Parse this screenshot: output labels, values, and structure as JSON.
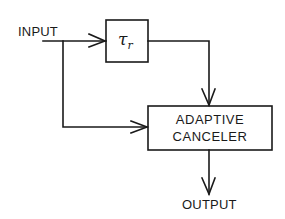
{
  "diagram": {
    "input_label": "INPUT",
    "output_label": "OUTPUT",
    "delay_block": {
      "symbol": "τ",
      "subscript": "r"
    },
    "canceler_block": {
      "line1": "ADAPTIVE",
      "line2": "CANCELER"
    },
    "connections": [
      {
        "from": "INPUT",
        "to": "delay_block"
      },
      {
        "from": "delay_block",
        "to": "canceler_block"
      },
      {
        "from": "INPUT",
        "to": "canceler_block"
      },
      {
        "from": "canceler_block",
        "to": "OUTPUT"
      }
    ],
    "colors": {
      "stroke": "#1a1a1a",
      "background": "#ffffff"
    }
  }
}
